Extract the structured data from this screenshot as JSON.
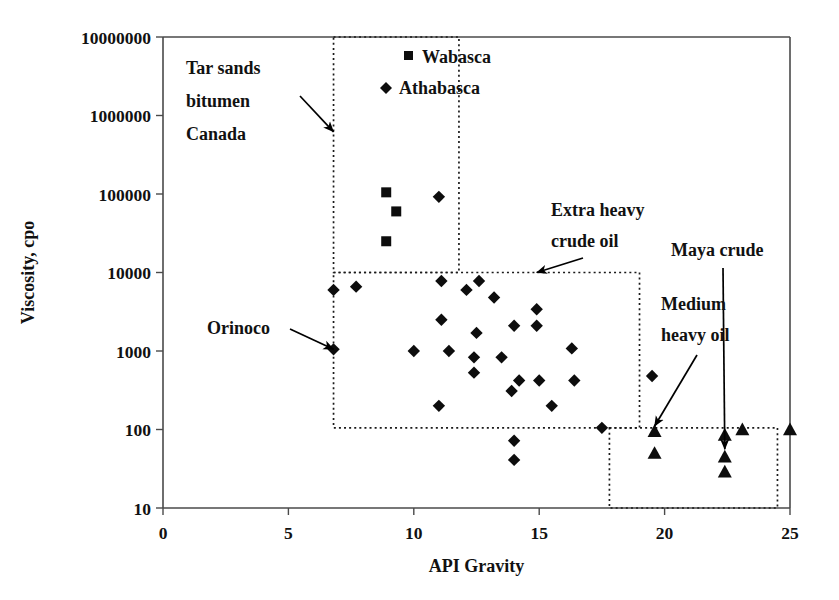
{
  "chart_data": {
    "type": "scatter",
    "title": "",
    "xlabel": "API Gravity",
    "ylabel": "Viscosity, cpo",
    "xlim": [
      0,
      25
    ],
    "ylim": [
      10,
      10000000
    ],
    "yscale": "log",
    "xscale": "linear",
    "grid": false,
    "legend_position": "top-center",
    "xticks": [
      0,
      5,
      10,
      15,
      20,
      25
    ],
    "xtick_labels": [
      "0",
      "5",
      "10",
      "15",
      "20",
      "25"
    ],
    "yticks": [
      10,
      100,
      1000,
      10000,
      100000,
      1000000,
      10000000
    ],
    "ytick_labels": [
      "10",
      "100",
      "1000",
      "10000",
      "100000",
      "1000000",
      "10000000"
    ],
    "legend": [
      {
        "label": "Wabasca",
        "marker": "square"
      },
      {
        "label": "Athabasca",
        "marker": "diamond"
      }
    ],
    "series": [
      {
        "name": "Wabasca",
        "marker": "square",
        "points": [
          {
            "x": 8.9,
            "y": 105000
          },
          {
            "x": 9.3,
            "y": 60000
          },
          {
            "x": 8.9,
            "y": 25000
          }
        ]
      },
      {
        "name": "Athabasca",
        "marker": "diamond",
        "points": [
          {
            "x": 11.0,
            "y": 92000
          },
          {
            "x": 6.8,
            "y": 6000
          },
          {
            "x": 7.7,
            "y": 6600
          },
          {
            "x": 11.1,
            "y": 7800
          },
          {
            "x": 12.6,
            "y": 7800
          },
          {
            "x": 12.1,
            "y": 6000
          },
          {
            "x": 13.2,
            "y": 4800
          },
          {
            "x": 14.9,
            "y": 3400
          },
          {
            "x": 11.1,
            "y": 2500
          },
          {
            "x": 14.0,
            "y": 2100
          },
          {
            "x": 14.9,
            "y": 2100
          },
          {
            "x": 12.5,
            "y": 1700
          },
          {
            "x": 6.8,
            "y": 1050
          },
          {
            "x": 10.0,
            "y": 1000
          },
          {
            "x": 11.4,
            "y": 1000
          },
          {
            "x": 12.4,
            "y": 830
          },
          {
            "x": 13.5,
            "y": 830
          },
          {
            "x": 16.3,
            "y": 1080
          },
          {
            "x": 12.4,
            "y": 530
          },
          {
            "x": 14.2,
            "y": 420
          },
          {
            "x": 15.0,
            "y": 420
          },
          {
            "x": 16.4,
            "y": 420
          },
          {
            "x": 19.5,
            "y": 480
          },
          {
            "x": 13.9,
            "y": 310
          },
          {
            "x": 11.0,
            "y": 200
          },
          {
            "x": 15.5,
            "y": 200
          },
          {
            "x": 17.5,
            "y": 105
          },
          {
            "x": 14.0,
            "y": 72
          },
          {
            "x": 14.0,
            "y": 41
          }
        ]
      },
      {
        "name": "Maya crude",
        "marker": "triangle",
        "points": [
          {
            "x": 19.6,
            "y": 95
          },
          {
            "x": 19.6,
            "y": 50
          },
          {
            "x": 22.4,
            "y": 85
          },
          {
            "x": 22.4,
            "y": 45
          },
          {
            "x": 22.4,
            "y": 29
          },
          {
            "x": 23.1,
            "y": 100
          },
          {
            "x": 25.0,
            "y": 100
          }
        ]
      }
    ],
    "regions": [
      {
        "name": "Tar sands bitumen Canada",
        "label": "Tar sands\nbitumen\nCanada",
        "x0": 6.8,
        "x1": 11.8,
        "y0": 10000,
        "y1": 10000000
      },
      {
        "name": "Extra heavy crude oil",
        "label": "Extra heavy\ncrude oil",
        "x0": 6.8,
        "x1": 19.0,
        "y0": 105,
        "y1": 10000
      },
      {
        "name": "Medium heavy oil",
        "label": "Medium\nheavy oil",
        "x0": 17.8,
        "x1": 24.5,
        "y0": 10,
        "y1": 105
      }
    ],
    "annotations": [
      {
        "id": "tar-sands",
        "lines": [
          "Tar sands",
          "bitumen",
          "Canada"
        ],
        "target": {
          "x": 6.8,
          "y": 620000
        }
      },
      {
        "id": "orinoco",
        "lines": [
          "Orinoco"
        ],
        "target": {
          "x": 6.8,
          "y": 1050
        }
      },
      {
        "id": "extra-heavy",
        "lines": [
          "Extra heavy",
          "crude oil"
        ],
        "target": {
          "x": 14.9,
          "y": 10000
        }
      },
      {
        "id": "maya-crude",
        "lines": [
          "Maya crude"
        ],
        "target": {
          "x": 22.4,
          "y": 56
        }
      },
      {
        "id": "medium-heavy",
        "lines": [
          "Medium",
          "heavy oil"
        ],
        "target": {
          "x": 19.6,
          "y": 110
        }
      }
    ]
  },
  "axes": {
    "x_title": "API Gravity",
    "y_title": "Viscosity, cpo",
    "x_labels": [
      "0",
      "5",
      "10",
      "15",
      "20",
      "25"
    ],
    "y_labels": [
      "10000000",
      "1000000",
      "100000",
      "10000",
      "1000",
      "100",
      "10"
    ]
  },
  "legend": {
    "wabasca": "Wabasca",
    "athabasca": "Athabasca"
  },
  "annotations": {
    "tar_sands_l1": "Tar sands",
    "tar_sands_l2": "bitumen",
    "tar_sands_l3": "Canada",
    "orinoco": "Orinoco",
    "extra_heavy_l1": "Extra heavy",
    "extra_heavy_l2": "crude oil",
    "maya_crude": "Maya crude",
    "medium_heavy_l1": "Medium",
    "medium_heavy_l2": "heavy oil"
  },
  "colors": {
    "marker": "#0d0d0d",
    "axis": "#4a4a4a",
    "box": "#1a1a1a",
    "text": "#111111",
    "background": "#ffffff"
  }
}
